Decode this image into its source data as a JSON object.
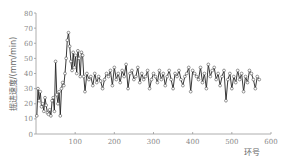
{
  "chart_data": {
    "type": "line",
    "title": "",
    "xlabel": "环号",
    "ylabel": "掘进速度/(mm/min)",
    "xlim": [
      0,
      600
    ],
    "ylim": [
      0,
      80
    ],
    "xticks": [
      100,
      200,
      300,
      400,
      500,
      600
    ],
    "yticks": [
      0,
      10,
      20,
      30,
      40,
      50,
      60,
      70,
      80
    ],
    "grid": false,
    "legend": null,
    "marker": "open-circle",
    "series": [
      {
        "name": "掘进速度",
        "x": [
          2,
          5,
          8,
          11,
          14,
          17,
          20,
          23,
          26,
          29,
          32,
          35,
          38,
          41,
          44,
          47,
          50,
          53,
          56,
          59,
          62,
          65,
          68,
          71,
          74,
          77,
          80,
          83,
          86,
          89,
          92,
          95,
          98,
          101,
          104,
          107,
          110,
          113,
          116,
          119,
          122,
          125,
          130,
          135,
          140,
          145,
          150,
          155,
          160,
          165,
          170,
          175,
          180,
          185,
          190,
          195,
          200,
          205,
          210,
          215,
          220,
          225,
          230,
          235,
          240,
          245,
          250,
          255,
          260,
          265,
          270,
          275,
          280,
          285,
          290,
          295,
          300,
          305,
          310,
          315,
          320,
          325,
          330,
          335,
          340,
          345,
          350,
          355,
          360,
          365,
          370,
          375,
          380,
          385,
          390,
          395,
          400,
          405,
          410,
          415,
          420,
          425,
          430,
          435,
          440,
          445,
          450,
          455,
          460,
          465,
          470,
          475,
          480,
          485,
          490,
          495,
          500,
          505,
          510,
          515,
          520,
          525,
          530,
          535,
          540,
          545,
          550,
          555,
          560,
          565,
          570
        ],
        "values": [
          12,
          30,
          22,
          28,
          18,
          20,
          15,
          24,
          19,
          14,
          13,
          16,
          12,
          22,
          24,
          15,
          48,
          26,
          20,
          28,
          12,
          30,
          34,
          32,
          40,
          50,
          62,
          67,
          58,
          48,
          42,
          54,
          44,
          52,
          40,
          55,
          50,
          38,
          54,
          52,
          38,
          28,
          40,
          36,
          38,
          32,
          40,
          34,
          38,
          35,
          30,
          36,
          40,
          38,
          42,
          32,
          44,
          36,
          40,
          34,
          42,
          38,
          46,
          30,
          40,
          42,
          36,
          38,
          44,
          34,
          40,
          36,
          38,
          42,
          30,
          36,
          40,
          38,
          34,
          42,
          36,
          40,
          32,
          38,
          42,
          36,
          30,
          40,
          38,
          42,
          36,
          32,
          38,
          40,
          44,
          28,
          42,
          40,
          38,
          36,
          44,
          34,
          40,
          30,
          46,
          38,
          42,
          44,
          36,
          40,
          32,
          38,
          42,
          22,
          36,
          40,
          30,
          38,
          34,
          42,
          36,
          40,
          28,
          38,
          34,
          42,
          40,
          36,
          30,
          38,
          36
        ]
      }
    ]
  }
}
